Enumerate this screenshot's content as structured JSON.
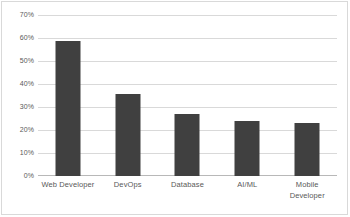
{
  "chart_data": {
    "type": "bar",
    "title": "",
    "subtitle": "",
    "xlabel": "",
    "ylabel": "",
    "categories": [
      "Web Developer",
      "DevOps",
      "Database",
      "AI/ML",
      "Mobile Developer"
    ],
    "values": [
      59,
      36,
      27,
      24,
      23
    ],
    "value_labels": [
      "59%",
      "36%",
      "27%",
      "24%",
      "23%"
    ],
    "ylim": [
      0,
      70
    ],
    "y_ticks": [
      0,
      10,
      20,
      30,
      40,
      50,
      60,
      70
    ],
    "y_tick_labels": [
      "0%",
      "10%",
      "20%",
      "30%",
      "40%",
      "50%",
      "60%",
      "70%"
    ],
    "grid": true,
    "legend": false,
    "legend_position": "none",
    "series": [
      {
        "name": "",
        "values": [
          59,
          36,
          27,
          24,
          23
        ]
      }
    ],
    "colors": {
      "bar": "#404040",
      "gridline": "#d9d9d9",
      "axis": "#b8b8b8",
      "tick_text": "#595959",
      "plot_background": "#ffffff",
      "frame_border": "#d9d9d9"
    }
  }
}
